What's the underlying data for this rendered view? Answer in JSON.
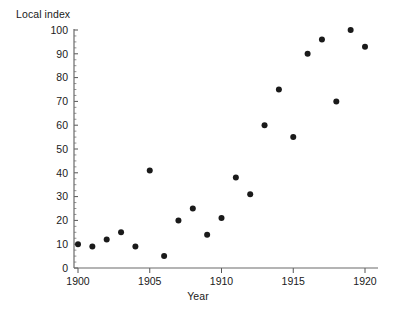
{
  "chart_data": {
    "type": "scatter",
    "title": "",
    "xlabel": "Year",
    "ylabel": "Local index",
    "xlim": [
      1900,
      1920
    ],
    "ylim": [
      0,
      100
    ],
    "grid": false,
    "legend": null,
    "x_ticks": [
      1900,
      1905,
      1910,
      1915,
      1920
    ],
    "x_tick_labels": [
      "1900",
      "1905",
      "1910",
      "1915",
      "1920"
    ],
    "x_minor_tick_step": 1,
    "y_ticks": [
      0,
      10,
      20,
      30,
      40,
      50,
      60,
      70,
      80,
      90,
      100
    ],
    "y_tick_labels": [
      "0",
      "10",
      "20",
      "30",
      "40",
      "50",
      "60",
      "70",
      "80",
      "90",
      "100"
    ],
    "y_minor_tick_step": 2.5,
    "marker": "filled-circle",
    "marker_color": "#1a1a1a",
    "marker_size": 3,
    "x": [
      1900,
      1901,
      1902,
      1903,
      1904,
      1905,
      1906,
      1907,
      1908,
      1909,
      1910,
      1911,
      1912,
      1913,
      1914,
      1915,
      1916,
      1917,
      1918,
      1919,
      1920
    ],
    "y": [
      10,
      9,
      12,
      15,
      9,
      41,
      5,
      20,
      25,
      14,
      21,
      38,
      31,
      60,
      75,
      55,
      90,
      96,
      70,
      100,
      93
    ],
    "points": [
      {
        "year": 1900,
        "value": 10
      },
      {
        "year": 1901,
        "value": 9
      },
      {
        "year": 1902,
        "value": 12
      },
      {
        "year": 1903,
        "value": 15
      },
      {
        "year": 1904,
        "value": 9
      },
      {
        "year": 1905,
        "value": 41
      },
      {
        "year": 1906,
        "value": 5
      },
      {
        "year": 1907,
        "value": 20
      },
      {
        "year": 1908,
        "value": 25
      },
      {
        "year": 1909,
        "value": 14
      },
      {
        "year": 1910,
        "value": 21
      },
      {
        "year": 1911,
        "value": 38
      },
      {
        "year": 1912,
        "value": 31
      },
      {
        "year": 1913,
        "value": 60
      },
      {
        "year": 1914,
        "value": 75
      },
      {
        "year": 1915,
        "value": 55
      },
      {
        "year": 1916,
        "value": 90
      },
      {
        "year": 1917,
        "value": 96
      },
      {
        "year": 1918,
        "value": 70
      },
      {
        "year": 1919,
        "value": 100
      },
      {
        "year": 1920,
        "value": 93
      }
    ]
  },
  "colors": {
    "background": "#ffffff",
    "axis": "#6b6b6b",
    "text": "#1a1a1a",
    "marker": "#1a1a1a"
  }
}
